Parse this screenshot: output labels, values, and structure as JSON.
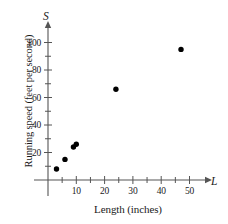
{
  "chart_data": {
    "type": "scatter",
    "title": "",
    "xlabel": "Length (inches)",
    "ylabel": "Running speed (feet per second)",
    "x_axis_variable": "L",
    "y_axis_variable": "S",
    "xlim": [
      0,
      57
    ],
    "ylim": [
      0,
      108
    ],
    "grid": false,
    "legend": "none",
    "x_ticks_major": [
      10,
      20,
      30,
      40,
      50
    ],
    "x_tick_labels": [
      "10",
      "20",
      "30",
      "40",
      "50"
    ],
    "x_ticks_minor": [
      5,
      15,
      25,
      35,
      45
    ],
    "y_ticks_major": [
      20,
      40,
      60,
      80,
      100
    ],
    "y_tick_labels": [
      "20",
      "40",
      "60",
      "80",
      "100"
    ],
    "y_ticks_minor": [
      10,
      30,
      50,
      70,
      90
    ],
    "series": [
      {
        "name": "Animal running speed vs length",
        "marker": "filled-circle",
        "color": "#000000",
        "points": [
          {
            "x": 3,
            "y": 8
          },
          {
            "x": 6,
            "y": 15
          },
          {
            "x": 9,
            "y": 24
          },
          {
            "x": 10,
            "y": 26
          },
          {
            "x": 24,
            "y": 66
          },
          {
            "x": 47,
            "y": 95
          }
        ]
      }
    ],
    "axis_color": "#555555",
    "marker_color": "#000000"
  }
}
